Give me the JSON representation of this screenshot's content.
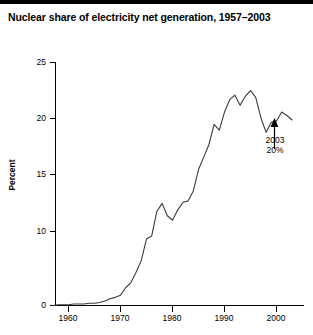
{
  "chart_data": {
    "type": "line",
    "title": "Nuclear share of electricity net generation, 1957–2003",
    "xlabel": "",
    "ylabel": "Percent",
    "xlim": [
      1957,
      2003
    ],
    "ylim": [
      0,
      25
    ],
    "grid": false,
    "legend": null,
    "y_axis_note": "broken axis: 0 to 10 compressed, then linear 10-25",
    "xticks": [
      1960,
      1970,
      1980,
      1990,
      2000
    ],
    "xtick_labels": [
      "1960",
      "1970",
      "1980",
      "1990",
      "2000"
    ],
    "yticks": [
      0,
      10,
      15,
      20,
      25
    ],
    "ytick_labels": [
      "0",
      "10",
      "15",
      "20",
      "25"
    ],
    "series": [
      {
        "name": "Nuclear share of electricity net generation",
        "x": [
          1957,
          1958,
          1959,
          1960,
          1961,
          1962,
          1963,
          1964,
          1965,
          1966,
          1967,
          1968,
          1969,
          1970,
          1971,
          1972,
          1973,
          1974,
          1975,
          1976,
          1977,
          1978,
          1979,
          1980,
          1981,
          1982,
          1983,
          1984,
          1985,
          1986,
          1987,
          1988,
          1989,
          1990,
          1991,
          1992,
          1993,
          1994,
          1995,
          1996,
          1997,
          1998,
          1999,
          2000,
          2001,
          2002,
          2003
        ],
        "values": [
          0.0,
          0.1,
          0.1,
          0.1,
          0.2,
          0.2,
          0.2,
          0.3,
          0.3,
          0.4,
          0.6,
          0.9,
          1.1,
          1.4,
          2.4,
          3.1,
          4.5,
          6.1,
          9.0,
          9.4,
          11.8,
          12.5,
          11.4,
          11.0,
          11.9,
          12.6,
          12.7,
          13.6,
          15.5,
          16.6,
          17.7,
          19.5,
          19.0,
          20.6,
          21.7,
          22.1,
          21.2,
          22.0,
          22.5,
          21.9,
          20.1,
          18.8,
          19.7,
          19.8,
          20.6,
          20.3,
          19.9
        ]
      }
    ],
    "annotations": [
      {
        "name": "endpoint-callout",
        "line1": "2003",
        "line2": "20%",
        "arrow": "up",
        "points_to_year": 2003,
        "points_to_value": 20
      }
    ]
  }
}
